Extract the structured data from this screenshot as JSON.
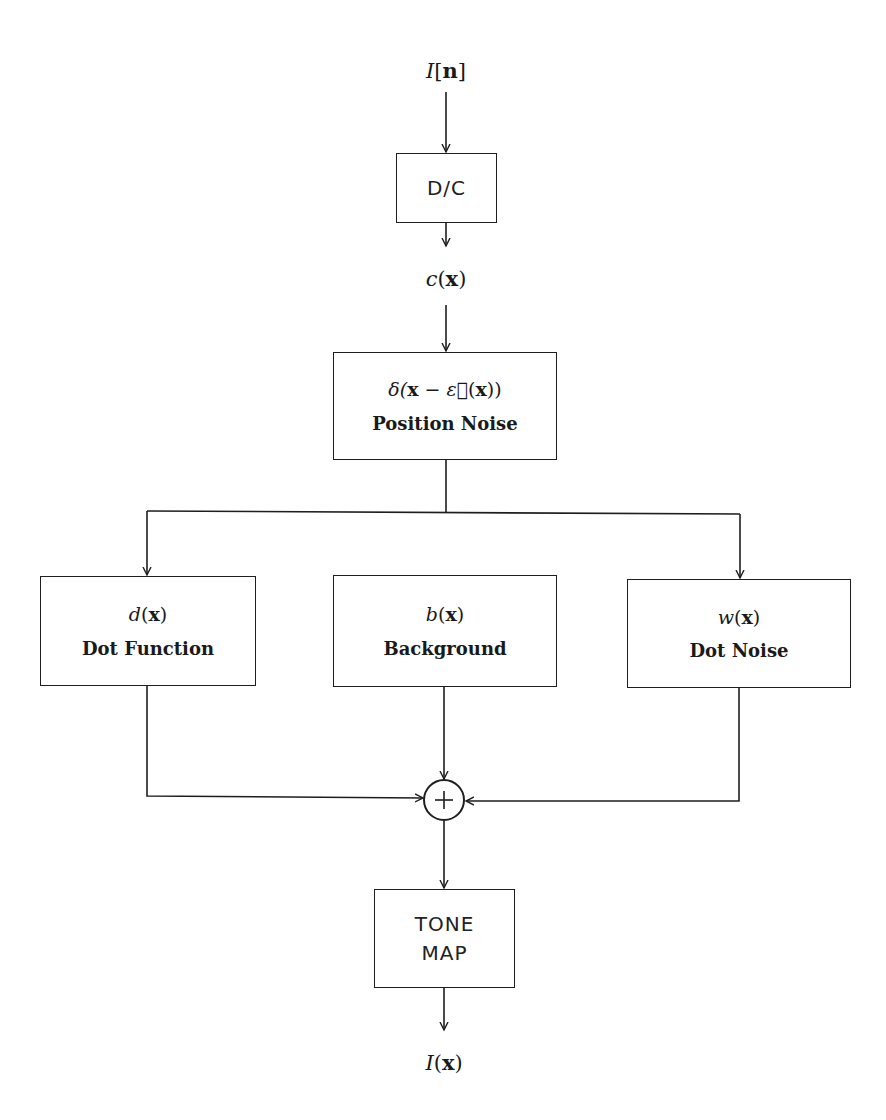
{
  "diagram": {
    "type": "block-diagram",
    "input_signal": {
      "var": "I",
      "arg": "n",
      "text": "I[n]"
    },
    "dc_block": {
      "label": "D/C"
    },
    "continuous_signal": {
      "var": "c",
      "arg": "x",
      "text": "c(x)"
    },
    "position_noise": {
      "formula_prefix": "δ(",
      "formula_x": "x",
      "formula_minus": " − ",
      "formula_eps": "ε⃗",
      "formula_arg_open": "(",
      "formula_arg": "x",
      "formula_close": "))",
      "formula_text": "δ(x − ε⃗(x))",
      "label": "Position Noise"
    },
    "branches": [
      {
        "var": "d",
        "arg": "x",
        "text": "d(x)",
        "label": "Dot Function",
        "has_input_arrow": true
      },
      {
        "var": "b",
        "arg": "x",
        "text": "b(x)",
        "label": "Background",
        "has_input_arrow": false
      },
      {
        "var": "w",
        "arg": "x",
        "text": "w(x)",
        "label": "Dot Noise",
        "has_input_arrow": true
      }
    ],
    "sum_junction": {
      "symbol": "+"
    },
    "tone_map": {
      "line1": "TONE",
      "line2": "MAP"
    },
    "output_signal": {
      "var": "I",
      "arg": "x",
      "text": "I(x)"
    }
  },
  "colors": {
    "ink": "#1e1e1e",
    "background": "#ffffff"
  }
}
